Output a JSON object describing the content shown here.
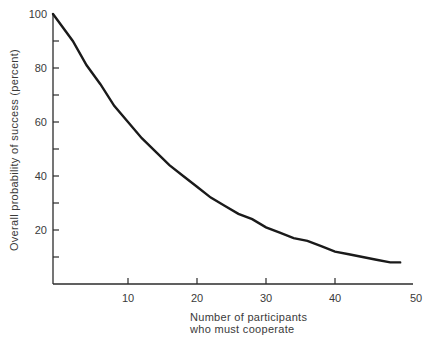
{
  "chart_data": {
    "type": "line",
    "title": "",
    "xlabel": "Number of participants who must cooperate",
    "xlabel_lines": [
      "Number of participants",
      "who must cooperate"
    ],
    "ylabel": "Overall probability of success (percent)",
    "xlim": [
      0,
      50
    ],
    "ylim": [
      0,
      100
    ],
    "x_ticks": [
      10,
      20,
      30,
      40,
      50
    ],
    "x_tick_labels": [
      "10",
      "20",
      "30",
      "40",
      "50"
    ],
    "y_ticks": [
      10,
      20,
      30,
      40,
      50,
      60,
      70,
      80,
      90,
      100
    ],
    "y_tick_labels": [
      "20",
      "40",
      "60",
      "80",
      "100"
    ],
    "y_labeled_ticks": [
      20,
      40,
      60,
      80,
      100
    ],
    "grid": false,
    "legend": null,
    "series": [
      {
        "name": "Overall probability of success",
        "x": [
          0,
          2,
          4,
          6,
          8,
          10,
          12,
          14,
          16,
          18,
          20,
          22,
          24,
          26,
          28,
          30,
          32,
          34,
          36,
          38,
          40,
          42,
          44,
          46,
          48
        ],
        "values": [
          100,
          90,
          81,
          74,
          66,
          60,
          54,
          49,
          44,
          40,
          36,
          32,
          29,
          26,
          24,
          21,
          19,
          17,
          16,
          14,
          12,
          11,
          10,
          9,
          8
        ]
      }
    ]
  }
}
